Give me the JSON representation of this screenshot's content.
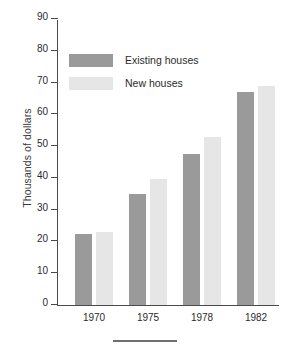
{
  "chart_data": {
    "type": "bar",
    "title": "",
    "xlabel": "",
    "ylabel": "Thousands of dollars",
    "categories": [
      "1970",
      "1975",
      "1978",
      "1982"
    ],
    "series": [
      {
        "name": "Existing houses",
        "color": "#9a9a9a",
        "values": [
          22.5,
          35,
          47.5,
          67
        ]
      },
      {
        "name": "New houses",
        "color": "#e6e6e6",
        "values": [
          23,
          39.5,
          53,
          69
        ]
      }
    ],
    "ylim": [
      0,
      90
    ],
    "ytick_step": 10,
    "yticks": [
      90,
      80,
      70,
      60,
      50,
      40,
      30,
      20,
      10,
      0
    ],
    "grid": false,
    "legend_position": "upper-left-inside"
  },
  "axis": {
    "y_title": "Thousands of dollars"
  },
  "legend": {
    "items": [
      {
        "label": "Existing houses"
      },
      {
        "label": "New houses"
      }
    ]
  },
  "footer": {
    "rule_color": "#6f6f6f"
  }
}
